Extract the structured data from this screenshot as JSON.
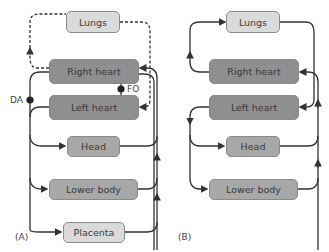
{
  "panel_a": {
    "label": "(A)",
    "nodes": {
      "lungs": "Lungs",
      "right_heart": "Right heart",
      "left_heart": "Left heart",
      "head": "Head",
      "lower_body": "Lower body",
      "placenta": "Placenta"
    },
    "shunts": {
      "da": "DA",
      "fo": "FO"
    }
  },
  "panel_b": {
    "label": "(B)",
    "nodes": {
      "lungs": "Lungs",
      "right_heart": "Right heart",
      "left_heart": "Left heart",
      "head": "Head",
      "lower_body": "Lower body"
    }
  },
  "colors": {
    "light_box": "#dadada",
    "mid_box": "#a8a8a8",
    "dark_box": "#8f8f8f",
    "line": "#333333"
  }
}
